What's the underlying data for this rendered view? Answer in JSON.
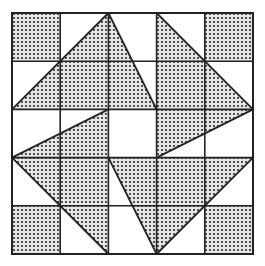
{
  "diagram": {
    "title": "",
    "grid": {
      "rows": 5,
      "cols": 5,
      "origin_px": [
        12,
        13
      ],
      "cell_px": 48.2
    },
    "colors": {
      "background": "#ffffff",
      "line": "#222222",
      "dot": "#333333",
      "dot_bg": "#e8e8e8"
    },
    "shaded_shapes": [
      {
        "id": "sq-top-left",
        "points": [
          [
            0,
            0
          ],
          [
            1,
            0
          ],
          [
            1,
            1
          ],
          [
            0,
            1
          ]
        ]
      },
      {
        "id": "sq-top-right",
        "points": [
          [
            4,
            0
          ],
          [
            5,
            0
          ],
          [
            5,
            1
          ],
          [
            4,
            1
          ]
        ]
      },
      {
        "id": "sq-bottom-left",
        "points": [
          [
            0,
            4
          ],
          [
            1,
            4
          ],
          [
            1,
            5
          ],
          [
            0,
            5
          ]
        ]
      },
      {
        "id": "sq-bottom-right",
        "points": [
          [
            4,
            4
          ],
          [
            5,
            4
          ],
          [
            5,
            5
          ],
          [
            4,
            5
          ]
        ]
      },
      {
        "id": "tri-top-left",
        "points": [
          [
            0,
            2
          ],
          [
            2,
            0
          ],
          [
            3,
            2
          ]
        ]
      },
      {
        "id": "tri-top-right",
        "points": [
          [
            3,
            0
          ],
          [
            5,
            2
          ],
          [
            3,
            2
          ]
        ]
      },
      {
        "id": "tri-mid-left",
        "points": [
          [
            0,
            3
          ],
          [
            2,
            2
          ],
          [
            2,
            3
          ]
        ]
      },
      {
        "id": "tri-mid-right",
        "points": [
          [
            3,
            2
          ],
          [
            5,
            2
          ],
          [
            3,
            3
          ]
        ]
      },
      {
        "id": "tri-bottom-left",
        "points": [
          [
            0,
            3
          ],
          [
            2,
            3
          ],
          [
            2,
            5
          ]
        ]
      },
      {
        "id": "tri-bottom-right",
        "points": [
          [
            2,
            3
          ],
          [
            5,
            3
          ],
          [
            3,
            5
          ]
        ]
      }
    ],
    "lines": [
      [
        [
          0,
          2
        ],
        [
          2,
          0
        ]
      ],
      [
        [
          2,
          0
        ],
        [
          3,
          2
        ]
      ],
      [
        [
          3,
          0
        ],
        [
          5,
          2
        ]
      ],
      [
        [
          0,
          3
        ],
        [
          2,
          2
        ]
      ],
      [
        [
          3,
          3
        ],
        [
          5,
          2
        ]
      ],
      [
        [
          0,
          3
        ],
        [
          2,
          5
        ]
      ],
      [
        [
          2,
          3
        ],
        [
          3,
          5
        ]
      ],
      [
        [
          3,
          5
        ],
        [
          5,
          3
        ]
      ]
    ]
  }
}
